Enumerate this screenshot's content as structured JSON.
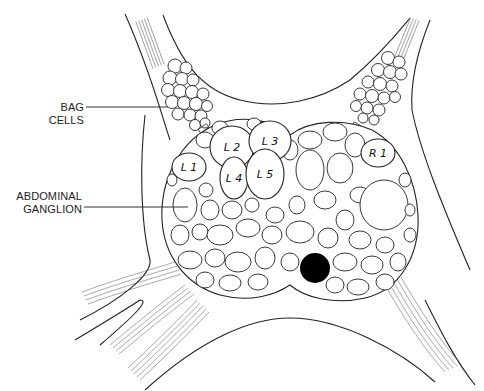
{
  "labels": {
    "bag_cells": "BAG CELLS",
    "abdominal_ganglion_line1": "ABDOMINAL",
    "abdominal_ganglion_line2": "GANGLION"
  },
  "neurons": [
    {
      "id": "L1",
      "label": "L 1",
      "cx": 189,
      "cy": 167,
      "rx": 17,
      "ry": 14
    },
    {
      "id": "L2",
      "label": "L 2",
      "cx": 232,
      "cy": 147,
      "rx": 22,
      "ry": 21
    },
    {
      "id": "L3",
      "label": "L 3",
      "cx": 270,
      "cy": 141,
      "rx": 21,
      "ry": 20
    },
    {
      "id": "L4",
      "label": "L 4",
      "cx": 234,
      "cy": 178,
      "rx": 14,
      "ry": 21
    },
    {
      "id": "L5",
      "label": "L 5",
      "cx": 265,
      "cy": 174,
      "rx": 19,
      "ry": 25
    },
    {
      "id": "R1",
      "label": "R 1",
      "cx": 378,
      "cy": 153,
      "rx": 17,
      "ry": 14
    }
  ],
  "colors": {
    "line": "#222222",
    "dark_cell": "#000000",
    "background": "#ffffff"
  }
}
